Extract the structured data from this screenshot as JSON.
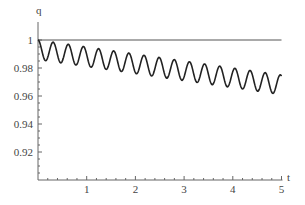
{
  "chart_data": {
    "type": "line",
    "title": "",
    "xlabel": "t",
    "ylabel": "q",
    "xlim": [
      0,
      5
    ],
    "ylim": [
      0.9,
      1.003
    ],
    "x_ticks": [
      1,
      2,
      3,
      4,
      5
    ],
    "x_tick_labels": [
      "1",
      "2",
      "3",
      "4",
      "5"
    ],
    "y_ticks": [
      1,
      0.98,
      0.96,
      0.94,
      0.92
    ],
    "y_tick_labels": [
      "1",
      "0.98",
      "0.96",
      "0.94",
      "0.92"
    ],
    "grid": false,
    "legend": null,
    "series": [
      {
        "name": "reference",
        "description": "constant line q = 1",
        "x": [
          0,
          5
        ],
        "values": [
          1,
          1
        ]
      },
      {
        "name": "q(t)",
        "description": "damped-drift oscillation, period ~0.31, drifting from 1 toward ~0.97",
        "model": "q = 1 - 0.005 t - 0.007 (1 - cos(20.2 t))",
        "x": [
          0,
          0.16,
          0.31,
          0.47,
          0.62,
          1.0,
          1.5,
          2.0,
          2.5,
          3.0,
          3.5,
          4.0,
          4.5,
          4.7,
          4.85,
          5.0
        ],
        "values": [
          1.0,
          0.985,
          0.998,
          0.984,
          0.996,
          0.986,
          0.99,
          0.982,
          0.984,
          0.976,
          0.98,
          0.974,
          0.974,
          0.976,
          0.961,
          0.97
        ],
        "peaks_approx": [
          1.0,
          0.998,
          0.996,
          0.994,
          0.993,
          0.991,
          0.989,
          0.988,
          0.986,
          0.984,
          0.983,
          0.981,
          0.98,
          0.978,
          0.976,
          0.975
        ],
        "troughs_approx": [
          0.985,
          0.983,
          0.982,
          0.98,
          0.978,
          0.977,
          0.975,
          0.973,
          0.972,
          0.97,
          0.968,
          0.967,
          0.965,
          0.963,
          0.962,
          0.961
        ]
      }
    ]
  },
  "labels": {
    "y_axis": "q",
    "x_axis": "t"
  }
}
